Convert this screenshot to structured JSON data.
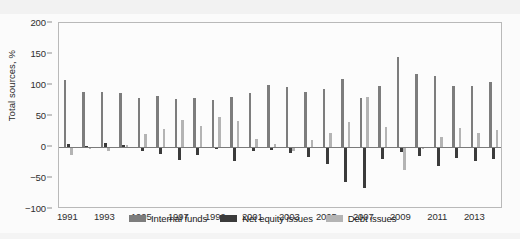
{
  "chart_data": {
    "type": "bar",
    "title": "",
    "subtitle": "",
    "xlabel": "",
    "ylabel": "Total sources, %",
    "ylim": [
      -100,
      200
    ],
    "yticks": [
      200,
      150,
      100,
      50,
      0,
      -50,
      -100
    ],
    "ytick_labels": [
      "200",
      "150",
      "100",
      "50",
      "0",
      "−50",
      "−100"
    ],
    "grid": false,
    "legend_position": "bottom-left-inside",
    "categories": [
      "1991",
      "1992",
      "1993",
      "1994",
      "1995",
      "1996",
      "1997",
      "1998",
      "1999",
      "2000",
      "2001",
      "2002",
      "2003",
      "2004",
      "2005",
      "2006",
      "2007",
      "2008",
      "2009",
      "2010",
      "2011",
      "2012",
      "2013",
      "2014"
    ],
    "xtick_labels": [
      "1991",
      "1993",
      "1995",
      "1997",
      "1999",
      "2001",
      "2003",
      "2005",
      "2007",
      "2009",
      "2011",
      "2013"
    ],
    "series": [
      {
        "name": "Internal funds",
        "color": "#7d7d7d",
        "values": [
          108,
          88,
          89,
          87,
          79,
          83,
          78,
          79,
          76,
          80,
          87,
          100,
          96,
          89,
          93,
          110,
          79,
          98,
          145,
          117,
          114,
          98,
          99,
          105
        ]
      },
      {
        "name": "Net equity issues",
        "color": "#3b3b3b",
        "values": [
          5,
          2,
          6,
          3,
          -6,
          -12,
          -21,
          -13,
          -4,
          -22,
          -7,
          -5,
          -10,
          -16,
          -28,
          -57,
          -66,
          -20,
          -8,
          -14,
          -30,
          -17,
          -23,
          -20
        ]
      },
      {
        "name": "Debt issues",
        "color": "#b4b4b4",
        "values": [
          -13,
          -4,
          -6,
          4,
          21,
          29,
          43,
          34,
          48,
          42,
          13,
          5,
          -7,
          12,
          22,
          41,
          80,
          32,
          -37,
          -3,
          16,
          30,
          22,
          28
        ]
      }
    ]
  },
  "axis": {
    "y_title": "Total sources, %"
  },
  "legend": {
    "items": [
      {
        "label": "Internal funds",
        "color": "#7d7d7d"
      },
      {
        "label": "Net equity issues",
        "color": "#3b3b3b"
      },
      {
        "label": "Debt issues",
        "color": "#b4b4b4"
      }
    ]
  }
}
